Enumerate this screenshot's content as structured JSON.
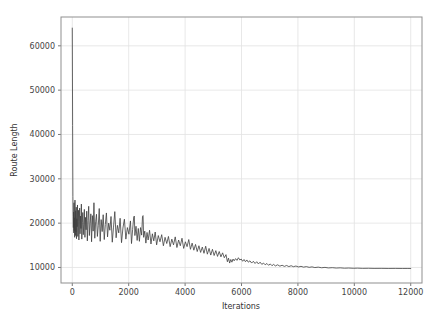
{
  "chart_data": {
    "type": "line",
    "title": "",
    "xlabel": "Iterations",
    "ylabel": "Route Length",
    "xlim": [
      -400,
      12400
    ],
    "ylim": [
      6500,
      66500
    ],
    "xticks": [
      0,
      2000,
      4000,
      6000,
      8000,
      10000,
      12000
    ],
    "xtick_labels": [
      "0",
      "2000",
      "4000",
      "6000",
      "8000",
      "10000",
      "12000"
    ],
    "yticks": [
      10000,
      20000,
      30000,
      40000,
      50000,
      60000
    ],
    "ytick_labels": [
      "10000",
      "20000",
      "30000",
      "40000",
      "50000",
      "60000"
    ],
    "grid": true,
    "legend": null,
    "series": [
      {
        "name": "route_length",
        "color": "#3f3f3f",
        "linewidth": 0.8,
        "description": "Simulated annealing route length vs iteration: starts at ~64000, collapses within ~50 iterations to ~20000, then noisily decays to an asymptote of ~9700 by ~9000 iterations.",
        "points": [
          [
            0,
            64000
          ],
          [
            12,
            42000
          ],
          [
            22,
            26000
          ],
          [
            30,
            21500
          ],
          [
            38,
            19000
          ],
          [
            46,
            22500
          ],
          [
            54,
            17800
          ],
          [
            62,
            24600
          ],
          [
            70,
            18300
          ],
          [
            78,
            21200
          ],
          [
            86,
            16800
          ],
          [
            95,
            25200
          ],
          [
            104,
            19400
          ],
          [
            112,
            17200
          ],
          [
            120,
            22800
          ],
          [
            130,
            18000
          ],
          [
            140,
            23600
          ],
          [
            150,
            16500
          ],
          [
            160,
            21000
          ],
          [
            172,
            19200
          ],
          [
            184,
            24100
          ],
          [
            196,
            17000
          ],
          [
            208,
            20400
          ],
          [
            220,
            22900
          ],
          [
            234,
            16200
          ],
          [
            248,
            19800
          ],
          [
            262,
            23400
          ],
          [
            276,
            17600
          ],
          [
            290,
            21600
          ],
          [
            306,
            18800
          ],
          [
            322,
            24300
          ],
          [
            338,
            16400
          ],
          [
            354,
            20100
          ],
          [
            372,
            22400
          ],
          [
            390,
            17400
          ],
          [
            408,
            19600
          ],
          [
            428,
            23100
          ],
          [
            448,
            16800
          ],
          [
            468,
            21300
          ],
          [
            490,
            18500
          ],
          [
            512,
            22700
          ],
          [
            534,
            16000
          ],
          [
            558,
            20600
          ],
          [
            582,
            23800
          ],
          [
            606,
            17200
          ],
          [
            632,
            19900
          ],
          [
            658,
            22100
          ],
          [
            684,
            15800
          ],
          [
            712,
            21700
          ],
          [
            740,
            18200
          ],
          [
            768,
            24600
          ],
          [
            798,
            16600
          ],
          [
            828,
            20300
          ],
          [
            858,
            22000
          ],
          [
            890,
            17000
          ],
          [
            922,
            19400
          ],
          [
            956,
            23300
          ],
          [
            990,
            15900
          ],
          [
            1024,
            20800
          ],
          [
            1060,
            18100
          ],
          [
            1096,
            21900
          ],
          [
            1134,
            16300
          ],
          [
            1172,
            19700
          ],
          [
            1210,
            22300
          ],
          [
            1250,
            16900
          ],
          [
            1290,
            20000
          ],
          [
            1332,
            18400
          ],
          [
            1374,
            21500
          ],
          [
            1418,
            15700
          ],
          [
            1462,
            19100
          ],
          [
            1508,
            22600
          ],
          [
            1554,
            16700
          ],
          [
            1600,
            19500
          ],
          [
            1648,
            17800
          ],
          [
            1696,
            21100
          ],
          [
            1746,
            15600
          ],
          [
            1796,
            18900
          ],
          [
            1848,
            20900
          ],
          [
            1900,
            16400
          ],
          [
            1954,
            19000
          ],
          [
            2008,
            17500
          ],
          [
            2062,
            20500
          ],
          [
            2100,
            15400
          ],
          [
            2140,
            18600
          ],
          [
            2180,
            21400
          ],
          [
            2200,
            21600
          ],
          [
            2220,
            17200
          ],
          [
            2260,
            19300
          ],
          [
            2300,
            16100
          ],
          [
            2340,
            18800
          ],
          [
            2380,
            15900
          ],
          [
            2420,
            19000
          ],
          [
            2460,
            17300
          ],
          [
            2490,
            21500
          ],
          [
            2510,
            21700
          ],
          [
            2530,
            16800
          ],
          [
            2570,
            18200
          ],
          [
            2610,
            15500
          ],
          [
            2650,
            17900
          ],
          [
            2690,
            16200
          ],
          [
            2740,
            18400
          ],
          [
            2790,
            15300
          ],
          [
            2840,
            17600
          ],
          [
            2890,
            16000
          ],
          [
            2940,
            18000
          ],
          [
            2990,
            15100
          ],
          [
            3050,
            17200
          ],
          [
            3110,
            15800
          ],
          [
            3170,
            17400
          ],
          [
            3230,
            14900
          ],
          [
            3290,
            16800
          ],
          [
            3350,
            15400
          ],
          [
            3410,
            17000
          ],
          [
            3470,
            14700
          ],
          [
            3530,
            16400
          ],
          [
            3590,
            15100
          ],
          [
            3650,
            16900
          ],
          [
            3710,
            14500
          ],
          [
            3770,
            16200
          ],
          [
            3830,
            14900
          ],
          [
            3890,
            16600
          ],
          [
            3950,
            14300
          ],
          [
            4010,
            15800
          ],
          [
            4070,
            14700
          ],
          [
            4130,
            16300
          ],
          [
            4190,
            14100
          ],
          [
            4250,
            15500
          ],
          [
            4310,
            13900
          ],
          [
            4370,
            15200
          ],
          [
            4430,
            13600
          ],
          [
            4490,
            14900
          ],
          [
            4550,
            13400
          ],
          [
            4610,
            14600
          ],
          [
            4670,
            13200
          ],
          [
            4730,
            14800
          ],
          [
            4790,
            13000
          ],
          [
            4850,
            14300
          ],
          [
            4910,
            12800
          ],
          [
            4970,
            14100
          ],
          [
            5030,
            12700
          ],
          [
            5090,
            13800
          ],
          [
            5150,
            12500
          ],
          [
            5210,
            13600
          ],
          [
            5270,
            12400
          ],
          [
            5330,
            13300
          ],
          [
            5390,
            12200
          ],
          [
            5450,
            12900
          ],
          [
            5500,
            11300
          ],
          [
            5540,
            12100
          ],
          [
            5580,
            11000
          ],
          [
            5620,
            11800
          ],
          [
            5660,
            11200
          ],
          [
            5700,
            11900
          ],
          [
            5740,
            11500
          ],
          [
            5790,
            12000
          ],
          [
            5840,
            11600
          ],
          [
            5890,
            12200
          ],
          [
            5940,
            11700
          ],
          [
            5990,
            11900
          ],
          [
            6040,
            11400
          ],
          [
            6090,
            11800
          ],
          [
            6140,
            11300
          ],
          [
            6190,
            11700
          ],
          [
            6240,
            11200
          ],
          [
            6300,
            11500
          ],
          [
            6360,
            11000
          ],
          [
            6420,
            11400
          ],
          [
            6480,
            10900
          ],
          [
            6540,
            11300
          ],
          [
            6600,
            10800
          ],
          [
            6660,
            11200
          ],
          [
            6720,
            10700
          ],
          [
            6780,
            11000
          ],
          [
            6840,
            10600
          ],
          [
            6900,
            10900
          ],
          [
            6960,
            10500
          ],
          [
            7020,
            10800
          ],
          [
            7080,
            10400
          ],
          [
            7140,
            10700
          ],
          [
            7200,
            10350
          ],
          [
            7280,
            10600
          ],
          [
            7360,
            10300
          ],
          [
            7440,
            10500
          ],
          [
            7520,
            10250
          ],
          [
            7600,
            10450
          ],
          [
            7680,
            10200
          ],
          [
            7760,
            10400
          ],
          [
            7840,
            10180
          ],
          [
            7930,
            10330
          ],
          [
            8020,
            10120
          ],
          [
            8110,
            10260
          ],
          [
            8200,
            10080
          ],
          [
            8300,
            10200
          ],
          [
            8400,
            10030
          ],
          [
            8500,
            10140
          ],
          [
            8600,
            9980
          ],
          [
            8720,
            10080
          ],
          [
            8840,
            9940
          ],
          [
            8960,
            10020
          ],
          [
            9080,
            9900
          ],
          [
            9220,
            9960
          ],
          [
            9360,
            9870
          ],
          [
            9500,
            9920
          ],
          [
            9650,
            9840
          ],
          [
            9800,
            9880
          ],
          [
            9960,
            9820
          ],
          [
            10120,
            9850
          ],
          [
            10300,
            9800
          ],
          [
            10500,
            9820
          ],
          [
            10700,
            9790
          ],
          [
            10950,
            9800
          ],
          [
            11200,
            9780
          ],
          [
            11450,
            9790
          ],
          [
            11700,
            9775
          ],
          [
            11900,
            9780
          ],
          [
            12000,
            9775
          ]
        ]
      }
    ]
  },
  "axes": {
    "spine_color": "#8f8f8f",
    "grid_color": "#e2e2e2",
    "tick_color": "#555555",
    "background": "#ffffff"
  }
}
